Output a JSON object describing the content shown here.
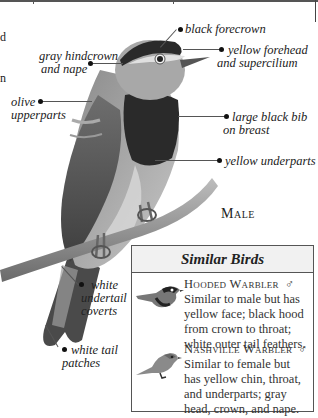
{
  "page": {
    "edge_fragments": [
      "d",
      "n"
    ],
    "sex_label": "Male"
  },
  "annotations": [
    {
      "id": "black-forecrown",
      "text": "black forecrown"
    },
    {
      "id": "gray-hindcrown",
      "line1": "gray hindcrown",
      "line2": "and nape"
    },
    {
      "id": "yellow-forehead",
      "line1": "yellow forehead",
      "line2": "and supercilium"
    },
    {
      "id": "olive-upperparts",
      "line1": "olive",
      "line2": "upperparts"
    },
    {
      "id": "black-bib",
      "line1": "large black bib",
      "line2": "on breast"
    },
    {
      "id": "yellow-underparts",
      "text": "yellow underparts"
    },
    {
      "id": "white-undertail",
      "line1": "white",
      "line2": "undertail",
      "line3": "coverts"
    },
    {
      "id": "white-tail-patches",
      "line1": "white tail",
      "line2": "patches"
    }
  ],
  "similar_birds": {
    "title": "Similar Birds",
    "entries": [
      {
        "name": "Hooded Warbler",
        "sex_symbol": "♂",
        "lines": [
          "Similar to male but has",
          "yellow face; black hood",
          "from crown to throat;",
          "white outer tail feathers."
        ]
      },
      {
        "name": "Nashville Warbler",
        "sex_symbol": "♂",
        "lines": [
          "Similar to female but",
          "has yellow chin, throat,",
          "and underparts; gray",
          "head, crown, and nape."
        ]
      }
    ]
  },
  "colors": {
    "ink": "#1a1a1a",
    "frame": "#555555",
    "header_bg": "#f1f1f1"
  }
}
